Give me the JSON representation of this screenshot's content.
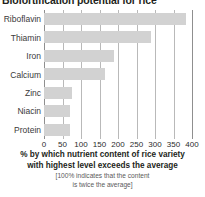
{
  "chart_data": {
    "type": "bar",
    "orientation": "horizontal",
    "title": "Biofortification potential for rice",
    "categories": [
      "Riboflavin",
      "Thiamin",
      "Iron",
      "Calcium",
      "Zinc",
      "Niacin",
      "Protein"
    ],
    "values": [
      385,
      290,
      190,
      165,
      75,
      70,
      70
    ],
    "xlabel_line1": "% by which nutrient content of rice variety",
    "xlabel_line2": "with highest level exceeds the average",
    "xlabel_note_line1": "[100% indicates that the content",
    "xlabel_note_line2": "is twice the average]",
    "ylabel": "",
    "xlim": [
      0,
      400
    ],
    "xticks": [
      0,
      50,
      100,
      150,
      200,
      250,
      300,
      350,
      400
    ],
    "xtick_labels": [
      "0",
      "50",
      "100",
      "150",
      "200",
      "250",
      "300",
      "350",
      "400"
    ],
    "grid": true,
    "grid_axis": "x",
    "legend": false,
    "bar_color": "#d2d2d2",
    "gridline_color": "#b9b9b9",
    "axis_color": "#8f8f8f",
    "background": "#ffffff"
  }
}
